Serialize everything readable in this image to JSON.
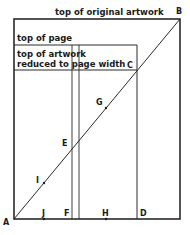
{
  "diagram": {
    "labels": {
      "top_original": "top of original artwork",
      "top_page": "top of page",
      "top_reduced_line1": "top of artwork",
      "top_reduced_line2": "reduced to page width"
    },
    "points": {
      "A": "A",
      "B": "B",
      "C": "C",
      "D": "D",
      "E": "E",
      "F": "F",
      "G": "G",
      "H": "H",
      "I": "I",
      "J": "J"
    },
    "line_color": "#2a2a2a"
  }
}
